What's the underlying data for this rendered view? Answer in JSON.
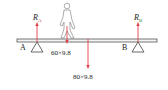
{
  "diagram": {
    "support_a": {
      "label": "A",
      "force_symbol": "R",
      "force_subscript": "A"
    },
    "support_b": {
      "label": "B",
      "force_symbol": "R",
      "force_subscript": "B"
    },
    "person_weight": "60×9.8",
    "beam_weight": "80×9.8",
    "colors": {
      "force_arrow": "#e0404a",
      "beam": "#555555",
      "subscript_b": "#3a8a3a"
    }
  }
}
